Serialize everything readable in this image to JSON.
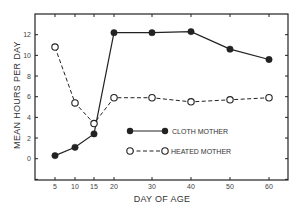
{
  "chart_data": {
    "type": "line",
    "title": "",
    "xlabel": "DAY OF AGE",
    "ylabel": "MEAN HOURS PER DAY",
    "x": [
      5,
      10,
      15,
      20,
      30,
      40,
      50,
      60
    ],
    "x_tick_labels": [
      "5",
      "10",
      "15",
      "20",
      "30",
      "40",
      "50",
      "60"
    ],
    "y_tick_labels": [
      "0",
      "2",
      "4",
      "6",
      "8",
      "10",
      "12"
    ],
    "ylim": [
      -2,
      14
    ],
    "grid": false,
    "legend_position": "center-right inside plot",
    "series": [
      {
        "name": "CLOTH MOTHER",
        "marker": "filled-circle",
        "line": "solid",
        "values": [
          0.3,
          1.1,
          2.4,
          12.2,
          12.2,
          12.3,
          10.6,
          9.6
        ]
      },
      {
        "name": "HEATED MOTHER",
        "marker": "open-circle",
        "line": "dashed",
        "values": [
          10.8,
          5.4,
          3.4,
          5.9,
          5.9,
          5.5,
          5.7,
          5.9
        ]
      }
    ]
  },
  "colors": {
    "ink": "#222222",
    "background": "#ffffff"
  }
}
